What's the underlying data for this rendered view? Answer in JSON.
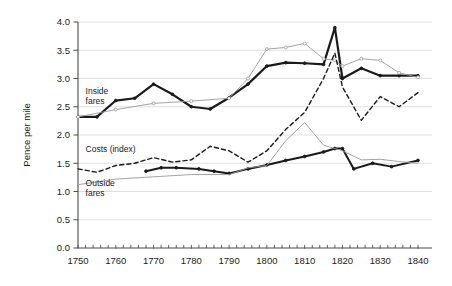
{
  "chart_data": {
    "type": "line",
    "title": "",
    "xlabel": "",
    "ylabel": "Pence per mile",
    "xlim": [
      1750,
      1840
    ],
    "ylim": [
      0.0,
      4.0
    ],
    "grid": true,
    "legend_position": "inline-annotations",
    "x_ticks": [
      1750,
      1760,
      1770,
      1780,
      1790,
      1800,
      1810,
      1820,
      1830,
      1840
    ],
    "x_tick_labels": [
      "1750",
      "1760",
      "1770",
      "1780",
      "1790",
      "1800",
      "1810",
      "1820",
      "1830",
      "1840"
    ],
    "x_minor_tick_interval": 2,
    "y_ticks": [
      0.0,
      0.5,
      1.0,
      1.5,
      2.0,
      2.5,
      3.0,
      3.5,
      4.0
    ],
    "y_tick_labels": [
      "0.0",
      "0.5",
      "1.0",
      "1.5",
      "2.0",
      "2.5",
      "3.0",
      "3.5",
      "4.0"
    ],
    "annotations": [
      {
        "text": "Inside\nfares",
        "line1": "Inside",
        "line2": "fares",
        "x": 1752,
        "y": 2.72
      },
      {
        "text": "Costs (index)",
        "line1": "Costs (index)",
        "line2": "",
        "x": 1752,
        "y": 1.7
      },
      {
        "text": "Outside\nfares",
        "line1": "Outside",
        "line2": "fares",
        "x": 1752,
        "y": 1.1
      }
    ],
    "series": [
      {
        "name": "Inside fares",
        "style": "thick-solid-black",
        "color": "#1a1a1a",
        "width": 2.2,
        "markers": true,
        "x": [
          1750,
          1755,
          1760,
          1765,
          1770,
          1775,
          1780,
          1785,
          1790,
          1795,
          1800,
          1805,
          1810,
          1815,
          1818,
          1820,
          1825,
          1830,
          1835,
          1840
        ],
        "values": [
          2.32,
          2.32,
          2.61,
          2.65,
          2.9,
          2.72,
          2.5,
          2.46,
          2.66,
          2.9,
          3.22,
          3.28,
          3.27,
          3.25,
          3.9,
          3.0,
          3.18,
          3.05,
          3.05,
          3.05
        ]
      },
      {
        "name": "Inside fares (alt series)",
        "style": "thin-solid-gray",
        "color": "#9a9a9a",
        "width": 0.9,
        "markers": true,
        "x": [
          1750,
          1760,
          1770,
          1780,
          1790,
          1795,
          1800,
          1805,
          1810,
          1815,
          1818,
          1820,
          1825,
          1830,
          1835,
          1840
        ],
        "values": [
          2.32,
          2.45,
          2.56,
          2.6,
          2.65,
          3.0,
          3.52,
          3.55,
          3.62,
          3.35,
          3.32,
          3.22,
          3.35,
          3.32,
          3.1,
          3.02
        ]
      },
      {
        "name": "Costs (index)",
        "style": "dashed-black",
        "color": "#1a1a1a",
        "width": 1.4,
        "markers": false,
        "x": [
          1750,
          1755,
          1760,
          1765,
          1770,
          1775,
          1780,
          1785,
          1790,
          1795,
          1800,
          1805,
          1810,
          1815,
          1818,
          1820,
          1825,
          1830,
          1835,
          1840
        ],
        "values": [
          1.4,
          1.34,
          1.46,
          1.5,
          1.6,
          1.52,
          1.56,
          1.8,
          1.72,
          1.52,
          1.72,
          2.1,
          2.4,
          3.0,
          3.45,
          2.85,
          2.26,
          2.68,
          2.5,
          2.75
        ]
      },
      {
        "name": "Outside fares",
        "style": "thick-solid-black",
        "color": "#1a1a1a",
        "width": 2.0,
        "markers": true,
        "x": [
          1768,
          1772,
          1776,
          1782,
          1786,
          1790,
          1795,
          1800,
          1805,
          1810,
          1815,
          1818,
          1820,
          1823,
          1828,
          1833,
          1840
        ],
        "values": [
          1.36,
          1.42,
          1.42,
          1.4,
          1.36,
          1.32,
          1.4,
          1.47,
          1.55,
          1.62,
          1.7,
          1.76,
          1.76,
          1.4,
          1.5,
          1.44,
          1.55
        ]
      },
      {
        "name": "Outside fares (alt series)",
        "style": "thin-solid-gray",
        "color": "#9a9a9a",
        "width": 0.9,
        "markers": false,
        "x": [
          1750,
          1760,
          1770,
          1780,
          1790,
          1795,
          1800,
          1805,
          1810,
          1815,
          1818,
          1820,
          1825,
          1830,
          1835,
          1840
        ],
        "values": [
          1.12,
          1.22,
          1.26,
          1.3,
          1.3,
          1.42,
          1.46,
          1.9,
          2.22,
          1.82,
          1.76,
          1.72,
          1.56,
          1.57,
          1.53,
          1.5
        ]
      }
    ]
  },
  "colors": {
    "axis": "#4a4a4a",
    "grid": "#d8d8d8",
    "series_dark": "#1a1a1a",
    "series_gray": "#9a9a9a",
    "background": "#ffffff"
  }
}
